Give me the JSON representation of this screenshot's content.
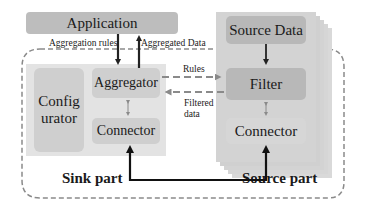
{
  "application": {
    "label": "Application"
  },
  "arrows": {
    "aggregation_rules": "Aggregation rules",
    "aggregated_data": "Aggregated Data",
    "rules": "Rules",
    "filtered_data_line1": "Filtered",
    "filtered_data_line2": "data"
  },
  "sink": {
    "configurator_line1": "Config",
    "configurator_line2": "urator",
    "aggregator": "Aggregator",
    "connector": "Connector",
    "part_label": "Sink part"
  },
  "source": {
    "source_data": "Source Data",
    "filter": "Filter",
    "connector": "Connector",
    "part_label": "Source part"
  }
}
